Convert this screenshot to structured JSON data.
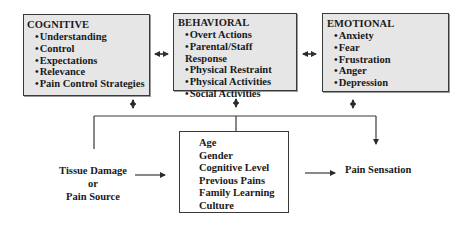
{
  "boxes": {
    "cognitive": {
      "title": "COGNITIVE",
      "items": [
        "Understanding",
        "Control",
        "Expectations",
        "Relevance",
        "Pain Control Strategies"
      ]
    },
    "behavioral": {
      "title": "BEHAVIORAL",
      "items": [
        "Overt Actions",
        "Parental/Staff Response",
        "Physical Restraint",
        "Physical Activities",
        "Social Activities"
      ]
    },
    "emotional": {
      "title": "EMOTIONAL",
      "items": [
        "Anxiety",
        "Fear",
        "Frustration",
        "Anger",
        "Depression"
      ]
    },
    "factors": {
      "items": [
        "Age",
        "Gender",
        "Cognitive Level",
        "Previous Pains",
        "Family Learning",
        "Culture"
      ]
    }
  },
  "source": {
    "line1": "Tissue Damage",
    "line2": "or",
    "line3": "Pain Source"
  },
  "outcome": {
    "label": "Pain Sensation"
  },
  "colors": {
    "box_fill": "#e6e6e6",
    "line": "#3a3a3a"
  }
}
